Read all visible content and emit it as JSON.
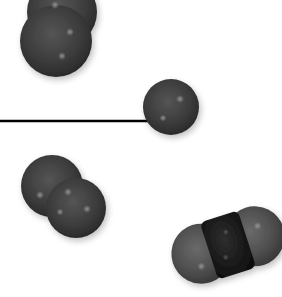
{
  "scene": {
    "description": "3D space-filling molecular models on white background",
    "background": "#ffffff",
    "atom_color_dark": "#3a3a3a",
    "atom_color_gray": "#555555",
    "atom_color_black": "#1a1a1a",
    "molecules": [
      {
        "name": "diatomic-molecule-top",
        "atoms": 2
      },
      {
        "name": "single-atom",
        "atoms": 1
      },
      {
        "name": "diatomic-molecule-bottom-left",
        "atoms": 2
      },
      {
        "name": "triatomic-molecule-bottom-right",
        "atoms": 3
      }
    ],
    "line": {
      "present": true,
      "color": "#000000"
    }
  }
}
